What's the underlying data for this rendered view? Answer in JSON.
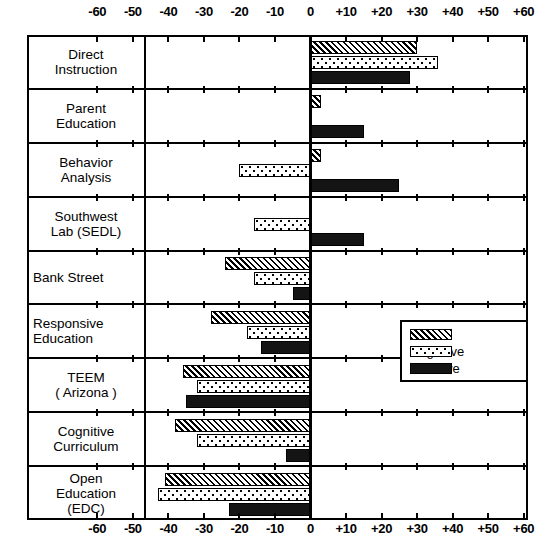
{
  "chart_data": {
    "type": "bar",
    "orientation": "horizontal",
    "title": "",
    "subtitle": "",
    "xlabel": "",
    "ylabel": "",
    "xlim": [
      -65,
      65
    ],
    "grid": false,
    "legend_position": "middle-right",
    "axis_note": "Diverging horizontal bars; axis duplicated top and bottom",
    "tick_labels": [
      "-60",
      "-50",
      "-40",
      "-30",
      "-20",
      "-10",
      "0",
      "+10",
      "+20",
      "+30",
      "+40",
      "+50",
      "+60"
    ],
    "tick_values": [
      -60,
      -50,
      -40,
      -30,
      -20,
      -10,
      0,
      10,
      20,
      30,
      40,
      50,
      60
    ],
    "categories": [
      "Direct Instruction",
      "Parent Education",
      "Behavior Analysis",
      "Southwest Lab (SEDL)",
      "Bank Street",
      "Responsive Education",
      "TEEM ( Arizona )",
      "Cognitive Curriculum",
      "Open Education (EDC)"
    ],
    "category_lines": [
      [
        "Direct",
        "Instruction"
      ],
      [
        "Parent",
        "Education"
      ],
      [
        "Behavior",
        "Analysis"
      ],
      [
        "Southwest",
        "Lab (SEDL)"
      ],
      [
        "Bank Street"
      ],
      [
        "Responsive",
        "Education"
      ],
      [
        "TEEM",
        "( Arizona )"
      ],
      [
        "Cognitive",
        "Curriculum"
      ],
      [
        "Open",
        "Education",
        "(EDC)"
      ]
    ],
    "series": [
      {
        "name": "Basics",
        "pattern": "diagonal-hatch",
        "values": [
          30,
          3,
          3,
          0,
          -24,
          -28,
          -36,
          -38,
          -41
        ]
      },
      {
        "name": "Cognitive",
        "pattern": "dotted-stipple",
        "values": [
          36,
          0,
          -20,
          -16,
          -16,
          -18,
          -32,
          -32,
          -43
        ]
      },
      {
        "name": "Affective",
        "pattern": "solid-black",
        "values": [
          28,
          15,
          25,
          15,
          -5,
          -14,
          -35,
          -7,
          -23
        ]
      }
    ]
  },
  "legend": {
    "items": [
      {
        "label": "Basics",
        "swatch": "diagonal-hatch-swatch"
      },
      {
        "label": "Cognitive",
        "swatch": "dotted-stipple-swatch"
      },
      {
        "label": "Affective",
        "swatch": "solid-black-swatch"
      }
    ]
  },
  "colors": {
    "ink": "#000000",
    "background": "#ffffff",
    "affective_fill": "#141414"
  }
}
